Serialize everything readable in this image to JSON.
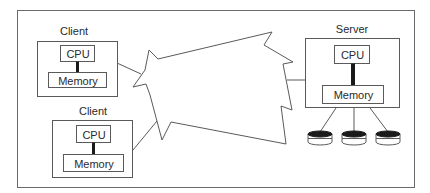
{
  "diagram": {
    "title": "",
    "colors": {
      "stroke": "#5a5a5a",
      "fill": "#ffffff",
      "dark": "#1a1a1a"
    },
    "clients": [
      {
        "label": "Client",
        "cpu": "CPU",
        "memory": "Memory"
      },
      {
        "label": "Client",
        "cpu": "CPU",
        "memory": "Memory"
      }
    ],
    "server": {
      "label": "Server",
      "cpu": "CPU",
      "memory": "Memory",
      "disks": 3
    },
    "network": {
      "label": ""
    }
  }
}
